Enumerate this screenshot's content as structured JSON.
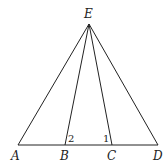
{
  "diagram": {
    "points": {
      "E": {
        "label": "E",
        "x": 89,
        "y": 24
      },
      "A": {
        "label": "A",
        "x": 18,
        "y": 145
      },
      "B": {
        "label": "B",
        "x": 65,
        "y": 145
      },
      "C": {
        "label": "C",
        "x": 112,
        "y": 145
      },
      "D": {
        "label": "D",
        "x": 158,
        "y": 145
      }
    },
    "segments": [
      "EA",
      "EB",
      "EC",
      "ED",
      "AD"
    ],
    "angles": [
      {
        "label": "2",
        "vertex": "B"
      },
      {
        "label": "1",
        "vertex": "C"
      }
    ]
  }
}
